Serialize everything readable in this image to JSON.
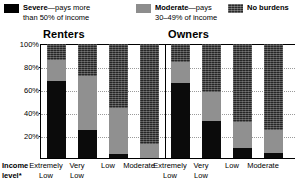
{
  "legend": {
    "items": [
      {
        "swatch": "severe-swatch",
        "bold": "Severe",
        "rest": "—pays more",
        "line2": "than 50% of income"
      },
      {
        "swatch": "moderate-swatch",
        "bold": "Moderate",
        "rest": "—pays",
        "line2": "30–49% of income"
      },
      {
        "swatch": "no-burdens-swatch",
        "bold": "No burdens",
        "rest": "",
        "line2": ""
      }
    ]
  },
  "axis": {
    "y_ticks": [
      "100%",
      "80%",
      "60%",
      "40%",
      "20%"
    ],
    "income_level_label_line1": "Income",
    "income_level_label_line2": "level*"
  },
  "groups": [
    {
      "title": "Renters"
    },
    {
      "title": "Owners"
    }
  ],
  "x_labels": [
    {
      "line1": "Extremely",
      "line2": "Low"
    },
    {
      "line1": "Very",
      "line2": "Low"
    },
    {
      "line1": "Low",
      "line2": ""
    },
    {
      "line1": "Moderate",
      "line2": ""
    },
    {
      "line1": "Extremely",
      "line2": "Low"
    },
    {
      "line1": "Very",
      "line2": "Low"
    },
    {
      "line1": "Low",
      "line2": ""
    },
    {
      "line1": "Moderate",
      "line2": ""
    }
  ],
  "colors": {
    "severe": "#0b0b0b",
    "moderate": "#909090",
    "no_burdens": "#262626",
    "grid": "#9a9a9a",
    "axis": "#000000",
    "background": "#ffffff"
  },
  "chart_data": {
    "type": "bar",
    "title": "",
    "subtitle": "",
    "xlabel": "Income level*",
    "ylabel": "",
    "ylim": [
      0,
      100
    ],
    "grid": true,
    "stacked": true,
    "stack_total": 100,
    "legend_position": "top",
    "groups": [
      "Renters",
      "Owners"
    ],
    "categories": [
      "Renters – Extremely Low",
      "Renters – Very Low",
      "Renters – Low",
      "Renters – Moderate",
      "Owners – Extremely Low",
      "Owners – Very Low",
      "Owners – Low",
      "Owners – Moderate"
    ],
    "series": [
      {
        "name": "Severe—pays more than 50% of income",
        "values": [
          68,
          25,
          4,
          1,
          66,
          33,
          10,
          5
        ]
      },
      {
        "name": "Moderate—pays 30–49% of income",
        "values": [
          18,
          47,
          40,
          12,
          18,
          25,
          22,
          20
        ]
      },
      {
        "name": "No burdens",
        "values": [
          14,
          28,
          56,
          87,
          16,
          42,
          68,
          75
        ]
      }
    ],
    "yticks": [
      20,
      40,
      60,
      80,
      100
    ],
    "ytick_labels": [
      "20%",
      "40%",
      "60%",
      "80%",
      "100%"
    ]
  }
}
